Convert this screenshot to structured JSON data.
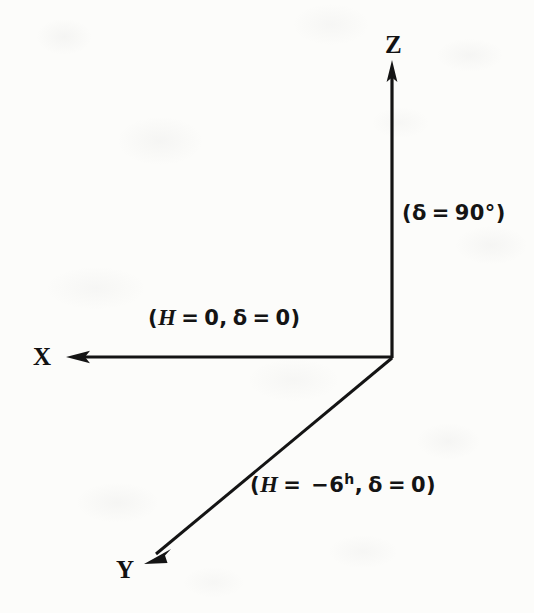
{
  "figure": {
    "background_color": "#fcfcfa",
    "ink_color": "#141414"
  },
  "axes": [
    {
      "id": "z-axis",
      "label": "Z",
      "direction": "up",
      "origin": [
        392,
        358
      ],
      "tip": [
        392,
        62
      ],
      "annotation": "(δ = 90°)"
    },
    {
      "id": "x-axis",
      "label": "X",
      "direction": "left",
      "origin": [
        392,
        357
      ],
      "tip": [
        67,
        357
      ],
      "annotation": "(H = 0, δ = 0)"
    },
    {
      "id": "y-axis",
      "label": "Y",
      "direction": "down-left",
      "origin": [
        392,
        358
      ],
      "tip": [
        145,
        563
      ],
      "annotation": "(H = −6h, δ = 0)"
    }
  ],
  "labels": {
    "z_letter": "Z",
    "x_letter": "X",
    "y_letter": "Y"
  },
  "annotations": {
    "z": {
      "open": "(",
      "delta": "δ",
      "eq": "=",
      "value": "90°",
      "close": ")"
    },
    "x": {
      "open": "(",
      "h": "H",
      "eq1": "=",
      "h_value": "0,",
      "delta": "δ",
      "eq2": "=",
      "delta_value": "0",
      "close": ")"
    },
    "y": {
      "open": "(",
      "h": "H",
      "eq1": "=",
      "h_value": "−6",
      "h_unit": "h",
      "comma": ",",
      "delta": "δ",
      "eq2": "=",
      "delta_value": "0",
      "close": ")"
    }
  }
}
